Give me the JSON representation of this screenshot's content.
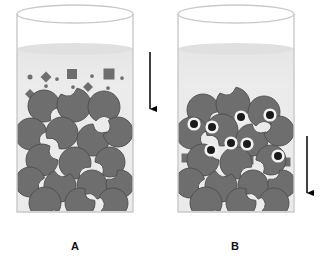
{
  "figure": {
    "type": "scientific-diagram",
    "background_color": "#ffffff"
  },
  "palette": {
    "beaker_outline": "#c9c9c9",
    "liquid_upper": "#efefef",
    "liquid_lower": "#e2e2e2",
    "bed_background": "#ebebeb",
    "particle_fill": "#6e6e6e",
    "particle_outline": "#4d4d4d",
    "solute_fill": "#6e6e6e",
    "captured_dot_fill": "#1a1a1a",
    "captured_halo_fill": "#f2f2f2",
    "arrow_color": "#000000",
    "label_color": "#111111"
  },
  "panels": [
    {
      "id": "panel-a",
      "label": "A",
      "beaker": {
        "x": 17,
        "y": 14,
        "width": 116,
        "height": 198,
        "rim_ellipse_ry": 9,
        "liquid_top_y": 49,
        "bed_top_y": 88
      },
      "solutes": [
        {
          "shape": "circle",
          "cx": 30,
          "cy": 77,
          "size": 4
        },
        {
          "shape": "circle",
          "cx": 46,
          "cy": 86,
          "size": 3
        },
        {
          "shape": "circle",
          "cx": 57,
          "cy": 79,
          "size": 3
        },
        {
          "shape": "circle",
          "cx": 73,
          "cy": 87,
          "size": 3
        },
        {
          "shape": "circle",
          "cx": 92,
          "cy": 76,
          "size": 3
        },
        {
          "shape": "circle",
          "cx": 108,
          "cy": 88,
          "size": 3
        },
        {
          "shape": "circle",
          "cx": 122,
          "cy": 78,
          "size": 3
        },
        {
          "shape": "diamond",
          "cx": 46,
          "cy": 77,
          "size": 11
        },
        {
          "shape": "diamond",
          "cx": 30,
          "cy": 94,
          "size": 10
        },
        {
          "shape": "diamond",
          "cx": 88,
          "cy": 87,
          "size": 10
        },
        {
          "shape": "square",
          "cx": 72,
          "cy": 74,
          "size": 10
        },
        {
          "shape": "square",
          "cx": 109,
          "cy": 74,
          "size": 11
        }
      ],
      "particles": [
        {
          "cx": 44,
          "cy": 106,
          "r": 16,
          "bite": 35
        },
        {
          "cx": 74,
          "cy": 105,
          "r": 17,
          "bite": 250
        },
        {
          "cx": 104,
          "cy": 107,
          "r": 16,
          "bite": 90
        },
        {
          "cx": 31,
          "cy": 134,
          "r": 16,
          "bite": 20
        },
        {
          "cx": 62,
          "cy": 133,
          "r": 16,
          "bite": 130
        },
        {
          "cx": 93,
          "cy": 140,
          "r": 16,
          "bite": 300
        },
        {
          "cx": 118,
          "cy": 132,
          "r": 15,
          "bite": 200
        },
        {
          "cx": 42,
          "cy": 160,
          "r": 16,
          "bite": 330
        },
        {
          "cx": 75,
          "cy": 163,
          "r": 16,
          "bite": 45
        },
        {
          "cx": 110,
          "cy": 162,
          "r": 15,
          "bite": 150
        },
        {
          "cx": 30,
          "cy": 182,
          "r": 15,
          "bite": 15
        },
        {
          "cx": 60,
          "cy": 186,
          "r": 16,
          "bite": 280
        },
        {
          "cx": 92,
          "cy": 185,
          "r": 15,
          "bite": 100
        },
        {
          "cx": 120,
          "cy": 184,
          "r": 14,
          "bite": 230
        },
        {
          "cx": 45,
          "cy": 203,
          "r": 16,
          "bite": 60
        },
        {
          "cx": 80,
          "cy": 203,
          "r": 15,
          "bite": 320
        },
        {
          "cx": 113,
          "cy": 203,
          "r": 15,
          "bite": 175
        }
      ],
      "captured": []
    },
    {
      "id": "panel-b",
      "label": "B",
      "beaker": {
        "x": 178,
        "y": 14,
        "width": 116,
        "height": 198,
        "rim_ellipse_ry": 9,
        "liquid_top_y": 49,
        "bed_top_y": 88
      },
      "solutes": [
        {
          "shape": "square",
          "cx": 186,
          "cy": 158,
          "size": 9
        },
        {
          "shape": "square",
          "cx": 249,
          "cy": 160,
          "size": 9
        },
        {
          "shape": "square",
          "cx": 286,
          "cy": 162,
          "size": 9
        }
      ],
      "particles": [
        {
          "cx": 203,
          "cy": 110,
          "r": 16,
          "bite": 35
        },
        {
          "cx": 233,
          "cy": 104,
          "r": 17,
          "bite": 250
        },
        {
          "cx": 264,
          "cy": 112,
          "r": 16,
          "bite": 90
        },
        {
          "cx": 192,
          "cy": 133,
          "r": 16,
          "bite": 20
        },
        {
          "cx": 222,
          "cy": 130,
          "r": 16,
          "bite": 130
        },
        {
          "cx": 252,
          "cy": 140,
          "r": 16,
          "bite": 300
        },
        {
          "cx": 279,
          "cy": 131,
          "r": 15,
          "bite": 200
        },
        {
          "cx": 203,
          "cy": 160,
          "r": 16,
          "bite": 330
        },
        {
          "cx": 236,
          "cy": 163,
          "r": 16,
          "bite": 45
        },
        {
          "cx": 271,
          "cy": 160,
          "r": 15,
          "bite": 150
        },
        {
          "cx": 190,
          "cy": 183,
          "r": 15,
          "bite": 15
        },
        {
          "cx": 221,
          "cy": 186,
          "r": 16,
          "bite": 280
        },
        {
          "cx": 253,
          "cy": 185,
          "r": 15,
          "bite": 100
        },
        {
          "cx": 282,
          "cy": 184,
          "r": 14,
          "bite": 230
        },
        {
          "cx": 206,
          "cy": 203,
          "r": 16,
          "bite": 60
        },
        {
          "cx": 241,
          "cy": 203,
          "r": 15,
          "bite": 320
        },
        {
          "cx": 274,
          "cy": 203,
          "r": 15,
          "bite": 175
        }
      ],
      "captured": [
        {
          "cx": 194,
          "cy": 124,
          "r": 4
        },
        {
          "cx": 212,
          "cy": 127,
          "r": 4
        },
        {
          "cx": 241,
          "cy": 117,
          "r": 4
        },
        {
          "cx": 270,
          "cy": 115,
          "r": 4
        },
        {
          "cx": 231,
          "cy": 143,
          "r": 4
        },
        {
          "cx": 247,
          "cy": 144,
          "r": 4
        },
        {
          "cx": 278,
          "cy": 156,
          "r": 4
        },
        {
          "cx": 211,
          "cy": 150,
          "r": 4
        }
      ]
    }
  ],
  "arrows": [
    {
      "id": "arrow-left",
      "x": 150,
      "y_start": 52,
      "y_end": 116,
      "direction": "down"
    },
    {
      "id": "arrow-right",
      "x": 307,
      "y_start": 136,
      "y_end": 200,
      "direction": "down"
    }
  ]
}
